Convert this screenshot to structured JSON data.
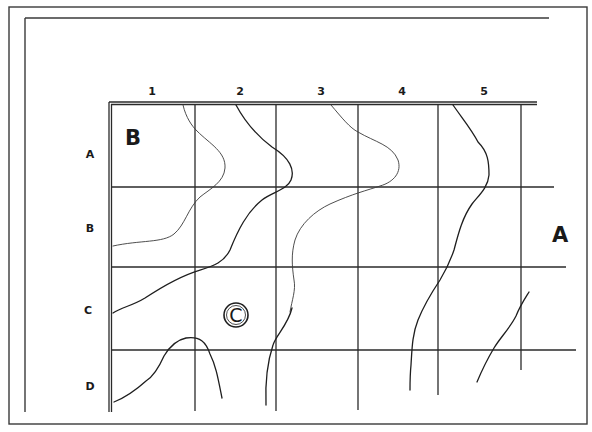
{
  "diagram": {
    "columns": [
      "1",
      "2",
      "3",
      "4",
      "5"
    ],
    "rows": [
      "A",
      "B",
      "C",
      "D"
    ],
    "regions": {
      "top_left": "B",
      "right": "A",
      "center": "C"
    },
    "colors": {
      "ink": "#1e1e1e",
      "background": "#ffffff"
    }
  }
}
